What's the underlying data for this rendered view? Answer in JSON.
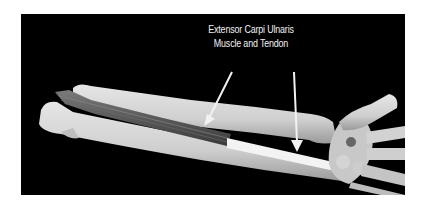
{
  "figure": {
    "label_line1": "Extensor Carpi Ulnaris",
    "label_line2": "Muscle and Tendon",
    "colors": {
      "background": "#000000",
      "page": "#ffffff",
      "bone": "#d9d9d9",
      "muscle": "#5a5a5a",
      "tendon": "#f0f0f0",
      "label": "#f2f2f2"
    },
    "arrows": [
      {
        "name": "muscle-arrow",
        "from": [
          211,
          58
        ],
        "to": [
          186,
          110
        ]
      },
      {
        "name": "tendon-arrow",
        "from": [
          273,
          58
        ],
        "to": [
          276,
          135
        ]
      }
    ]
  }
}
